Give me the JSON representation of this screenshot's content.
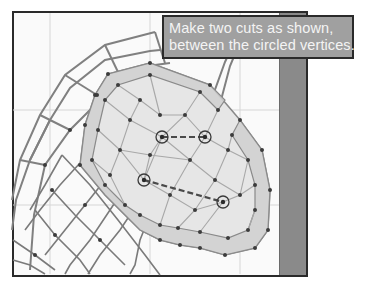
{
  "callout": {
    "line1": "Make two cuts as shown,",
    "line2": "between the circled vertices."
  },
  "colors": {
    "frame_border": "#2a2a2a",
    "viewport_bg": "#fafafa",
    "side_strip": "#8a8a8a",
    "callout_bg": "#a0a0a0",
    "callout_text": "#f4f4f4",
    "mesh_edge": "#7a7a7a",
    "vertex": "#3c3c3c",
    "selected_face": "#d8d8d8"
  },
  "mesh": {
    "circled_vertices": [
      {
        "x": 162,
        "y": 137
      },
      {
        "x": 205,
        "y": 137
      },
      {
        "x": 144,
        "y": 180
      },
      {
        "x": 223,
        "y": 202
      }
    ],
    "cuts": [
      {
        "from": 0,
        "to": 1
      },
      {
        "from": 2,
        "to": 3
      }
    ]
  }
}
